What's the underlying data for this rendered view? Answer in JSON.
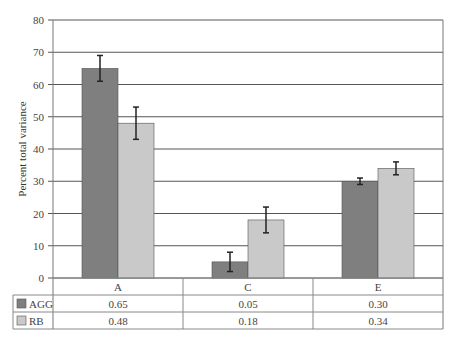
{
  "chart_data": {
    "type": "bar",
    "title": "",
    "xlabel": "",
    "ylabel": "Percent total variance",
    "ylim": [
      0,
      80
    ],
    "yticks": [
      0,
      10,
      20,
      30,
      40,
      50,
      60,
      70,
      80
    ],
    "grid": true,
    "legend_position": "data-table-left",
    "categories": [
      "A",
      "C",
      "E"
    ],
    "series": [
      {
        "name": "AGG",
        "color": "#7f7f7f",
        "values": [
          65,
          5,
          30
        ],
        "errors": [
          4,
          3,
          1
        ],
        "table_values": [
          "0.65",
          "0.05",
          "0.30"
        ]
      },
      {
        "name": "RB",
        "color": "#c9c9c9",
        "values": [
          48,
          18,
          34
        ],
        "errors": [
          5,
          4,
          2
        ],
        "table_values": [
          "0.48",
          "0.18",
          "0.34"
        ]
      }
    ]
  },
  "colors": {
    "grid": "#555555",
    "axis": "#777777",
    "table_border": "#888888",
    "bar_border": "#555555",
    "error_bar": "#222222"
  }
}
